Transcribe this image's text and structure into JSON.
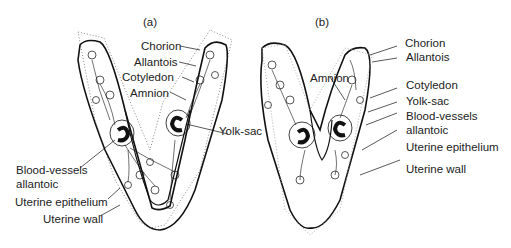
{
  "panels": {
    "a": {
      "label": "(a)",
      "annotations": {
        "chorion": "Chorion",
        "allantois": "Allantois",
        "cotyledon": "Cotyledon",
        "amnion": "Amnion",
        "yolk_sac": "Yolk-sac",
        "blood_vessels_1": "Blood-vessels",
        "blood_vessels_2": "allantoic",
        "uterine_epithelium": "Uterine epithelium",
        "uterine_wall": "Uterine wall"
      }
    },
    "b": {
      "label": "(b)",
      "annotations": {
        "chorion": "Chorion",
        "allantois": "Allantois",
        "amnion": "Amnion",
        "cotyledon": "Cotyledon",
        "yolk_sac": "Yolk-sac",
        "blood_vessels_1": "Blood-vessels",
        "blood_vessels_2": "allantoic",
        "uterine_epithelium": "Uterine epithelium",
        "uterine_wall": "Uterine wall"
      }
    }
  }
}
